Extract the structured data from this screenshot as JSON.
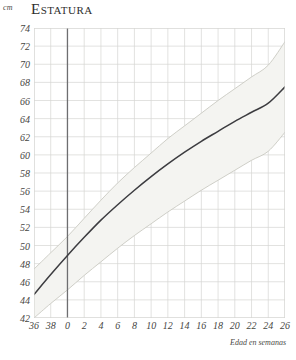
{
  "header": {
    "unit": "cm",
    "title": "Estatura"
  },
  "axis_caption": "Edad en semanas",
  "chart_data": {
    "type": "line",
    "title": "Estatura",
    "xlabel": "Edad en semanas",
    "ylabel": "cm",
    "grid": true,
    "legend": "none",
    "ylim": [
      42,
      74
    ],
    "ytick_labels": [
      "74",
      "72",
      "70",
      "68",
      "66",
      "64",
      "62",
      "60",
      "58",
      "56",
      "54",
      "52",
      "50",
      "48",
      "46",
      "44",
      "42"
    ],
    "ytick_values": [
      74,
      72,
      70,
      68,
      66,
      64,
      62,
      60,
      58,
      56,
      54,
      52,
      50,
      48,
      46,
      44,
      42
    ],
    "xtick_labels": [
      "36",
      "38",
      "0",
      "2",
      "4",
      "6",
      "8",
      "10",
      "12",
      "14",
      "16",
      "18",
      "20",
      "22",
      "24",
      "26"
    ],
    "x_positions": [
      -4,
      -2,
      0,
      2,
      4,
      6,
      8,
      10,
      12,
      14,
      16,
      18,
      20,
      22,
      24,
      26
    ],
    "xlim": [
      -4,
      26
    ],
    "birth_marker_x": 0,
    "series": [
      {
        "name": "upper-band",
        "style": "light-gray-line",
        "color": "#c9c9c2",
        "x": [
          -4,
          -2,
          0,
          2,
          4,
          6,
          8,
          10,
          12,
          14,
          16,
          18,
          20,
          22,
          24,
          26
        ],
        "values": [
          47.4,
          49.2,
          51.0,
          53.0,
          55.0,
          56.9,
          58.6,
          60.2,
          61.8,
          63.2,
          64.6,
          66.0,
          67.3,
          68.6,
          69.9,
          72.5
        ]
      },
      {
        "name": "median",
        "style": "dark-line",
        "color": "#3c3c40",
        "x": [
          -4,
          -2,
          0,
          2,
          4,
          6,
          8,
          10,
          12,
          14,
          16,
          18,
          20,
          22,
          24,
          26
        ],
        "values": [
          44.6,
          46.8,
          48.9,
          50.9,
          52.8,
          54.5,
          56.1,
          57.6,
          59.0,
          60.3,
          61.5,
          62.6,
          63.7,
          64.7,
          65.7,
          67.5
        ]
      },
      {
        "name": "lower-band",
        "style": "light-gray-line",
        "color": "#c9c9c2",
        "x": [
          -4,
          -2,
          0,
          2,
          4,
          6,
          8,
          10,
          12,
          14,
          16,
          18,
          20,
          22,
          24,
          26
        ],
        "values": [
          42.0,
          43.6,
          45.1,
          46.7,
          48.2,
          49.7,
          51.1,
          52.4,
          53.7,
          54.9,
          56.1,
          57.2,
          58.3,
          59.4,
          60.4,
          62.5
        ]
      }
    ],
    "band_fill": "#f4f4f1"
  },
  "colors": {
    "median_line": "#3c3c40",
    "band_line": "#c9c9c2",
    "band_fill": "#f4f4f1",
    "grid_line": "#d6d6d2",
    "birth_line": "#6e6e70",
    "text": "#46463f"
  }
}
